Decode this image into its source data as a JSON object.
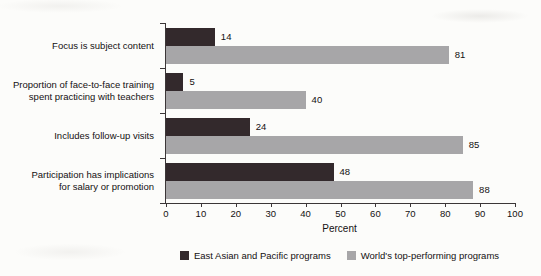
{
  "chart_data": {
    "type": "bar",
    "orientation": "horizontal",
    "title": "",
    "xlabel": "Percent",
    "ylabel": "",
    "xlim": [
      0,
      100
    ],
    "xticks": [
      0,
      10,
      20,
      30,
      40,
      50,
      60,
      70,
      80,
      90,
      100
    ],
    "grid": false,
    "value_labels": true,
    "legend_position": "bottom",
    "categories": [
      "Focus is subject content",
      "Proportion of face-to-face training spent practicing with teachers",
      "Includes follow-up visits",
      "Participation has implications for salary or promotion"
    ],
    "category_label_lines": [
      [
        "Focus is subject content"
      ],
      [
        "Proportion of face-to-face training",
        "spent practicing with teachers"
      ],
      [
        "Includes follow-up visits"
      ],
      [
        "Participation has implications",
        "for salary or promotion"
      ]
    ],
    "series": [
      {
        "key": "east-asian-pacific",
        "name": "East Asian and Pacific programs",
        "color": "#33292c",
        "values": [
          14,
          5,
          24,
          48
        ]
      },
      {
        "key": "world-top-performing",
        "name": "World's top-performing programs",
        "color": "#a7a6a8",
        "values": [
          81,
          40,
          85,
          88
        ]
      }
    ],
    "colors": {
      "axis": "#3b3637",
      "text": "#141011",
      "background": "#fcfcfa"
    }
  }
}
